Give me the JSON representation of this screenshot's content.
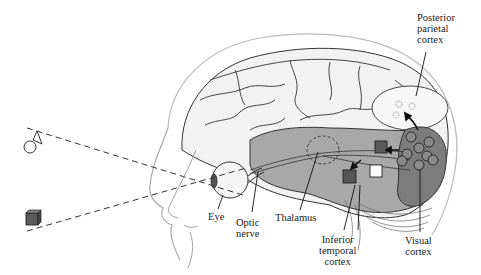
{
  "diagram": {
    "labels": {
      "posterior_parietal": "Posterior\nparietal\ncortex",
      "eye": "Eye",
      "optic_nerve": "Optic\nnerve",
      "thalamus": "Thalamus",
      "inferior_temporal": "Inferior\ntemporal\ncortex",
      "visual_cortex": "Visual\ncortex"
    },
    "objects": {
      "viewed_object_top": "cone-on-sphere",
      "viewed_object_bottom": "cube"
    },
    "colors": {
      "brain_fill": "#efefef",
      "temporal_shade": "#a6a6a6",
      "visual_cortex_shade": "#7a7a7a",
      "cube_dark": "#555555",
      "line": "#222222"
    }
  }
}
